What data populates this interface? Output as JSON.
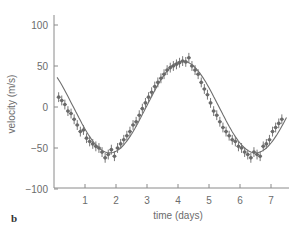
{
  "chart_data": {
    "type": "scatter",
    "title": "",
    "panel_label": "b",
    "xlabel": "time (days)",
    "ylabel": "velocity (m/s)",
    "xlim": [
      0,
      7.6
    ],
    "ylim": [
      -100,
      115
    ],
    "xticks": [
      1,
      2,
      3,
      4,
      5,
      6,
      7
    ],
    "yticks": [
      100,
      50,
      0,
      -50,
      -100
    ],
    "grid": false,
    "legend": null,
    "fit_curve": {
      "type": "sinusoid",
      "amplitude": 56,
      "period_days": 4.7,
      "peak_time_days": 4.15,
      "offset": 0,
      "x_range": [
        0.1,
        7.5
      ]
    },
    "series": [
      {
        "name": "measurements",
        "x": [
          0.15,
          0.25,
          0.35,
          0.45,
          0.55,
          0.65,
          0.75,
          0.85,
          0.95,
          1.05,
          1.15,
          1.25,
          1.35,
          1.45,
          1.55,
          1.65,
          1.75,
          1.85,
          1.95,
          2.05,
          2.15,
          2.25,
          2.35,
          2.45,
          2.55,
          2.65,
          2.75,
          2.85,
          2.95,
          3.05,
          3.15,
          3.25,
          3.35,
          3.45,
          3.55,
          3.65,
          3.75,
          3.85,
          3.95,
          4.05,
          4.15,
          4.25,
          4.35,
          4.45,
          4.55,
          4.65,
          4.75,
          4.85,
          4.95,
          5.05,
          5.15,
          5.25,
          5.35,
          5.45,
          5.55,
          5.65,
          5.75,
          5.85,
          5.95,
          6.05,
          6.15,
          6.25,
          6.35,
          6.45,
          6.55,
          6.65,
          6.75,
          6.85,
          6.95,
          7.05,
          7.15,
          7.25,
          7.35
        ],
        "y": [
          12,
          8,
          3,
          -5,
          -8,
          -15,
          -22,
          -30,
          -28,
          -38,
          -42,
          -45,
          -48,
          -50,
          -55,
          -62,
          -58,
          -52,
          -60,
          -50,
          -45,
          -40,
          -35,
          -30,
          -22,
          -18,
          -10,
          -2,
          5,
          12,
          18,
          25,
          30,
          35,
          40,
          45,
          48,
          50,
          52,
          54,
          56,
          55,
          60,
          50,
          45,
          40,
          30,
          22,
          15,
          5,
          -5,
          -10,
          -18,
          -25,
          -30,
          -35,
          -40,
          -42,
          -48,
          -50,
          -55,
          -58,
          -62,
          -55,
          -58,
          -60,
          -48,
          -45,
          -40,
          -30,
          -25,
          -20,
          -15
        ]
      }
    ],
    "error_bar_approx": 6
  }
}
